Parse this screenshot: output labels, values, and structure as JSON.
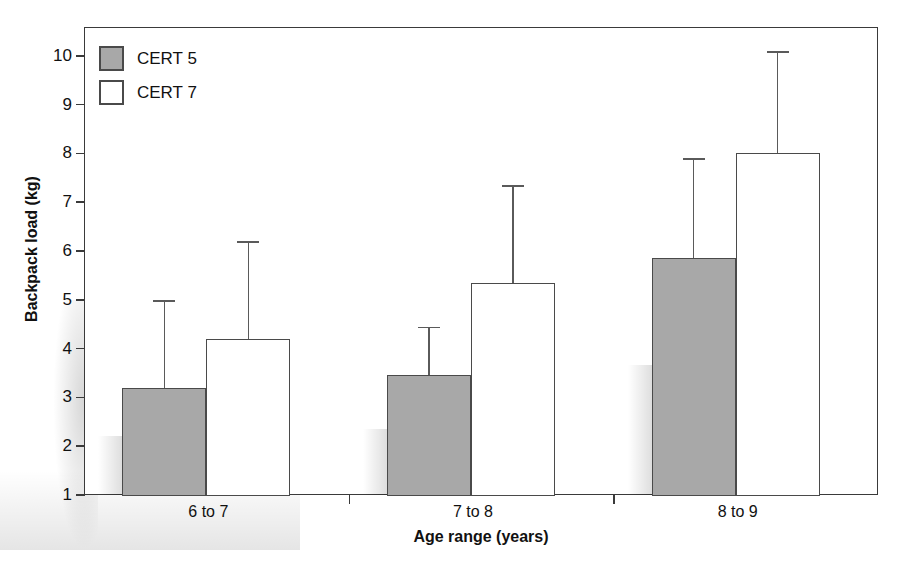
{
  "chart_data": {
    "type": "bar",
    "title": "",
    "xlabel": "Age range (years)",
    "ylabel": "Backpack load (kg)",
    "categories": [
      "6 to 7",
      "7 to 8",
      "8 to 9"
    ],
    "ylim": [
      1,
      10.4
    ],
    "yticks": [
      1,
      2,
      3,
      4,
      5,
      6,
      7,
      8,
      9,
      10
    ],
    "ytick_labels": [
      "1",
      "2",
      "3",
      "4",
      "5",
      "6",
      "7",
      "8",
      "9",
      "10"
    ],
    "grid": false,
    "legend_position": "top-left",
    "series": [
      {
        "name": "CERT 5",
        "color": "#a8a8a8",
        "values": [
          3.2,
          3.45,
          5.85
        ],
        "errors_upper": [
          5.0,
          4.45,
          7.9
        ]
      },
      {
        "name": "CERT 7",
        "color": "#ffffff",
        "values": [
          4.2,
          5.35,
          8.0
        ],
        "errors_upper": [
          6.2,
          7.35,
          10.1
        ]
      }
    ]
  },
  "axes": {
    "ylabel": "Backpack load (kg)",
    "xlabel": "Age range (years)"
  },
  "legend": {
    "items": [
      {
        "label": "CERT 5",
        "swatch": "filled-gray-swatch"
      },
      {
        "label": "CERT 7",
        "swatch": "empty-white-swatch"
      }
    ]
  }
}
